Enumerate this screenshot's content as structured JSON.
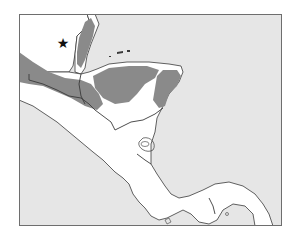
{
  "map": {
    "region": "Central America",
    "colors": {
      "ocean": "#e6e6e6",
      "land": "#ffffff",
      "range": "#8a8a8a",
      "border": "#3a3a3a",
      "frame": "#6e6e6e"
    },
    "marker": {
      "symbol": "★",
      "location": "northern Guatemala (Petén)"
    },
    "shaded_range_label": "distribution range"
  }
}
